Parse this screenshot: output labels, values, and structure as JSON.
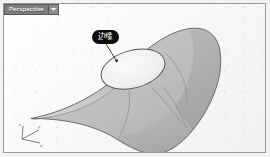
{
  "app": {
    "type": "3d-modeling-viewport",
    "background_color": "#fbfbfb"
  },
  "viewport": {
    "tab": {
      "label": "Perspective",
      "dropdown_icon": "chevron-down-icon",
      "background_color": "#7e7e7e",
      "text_color": "#f2f2f2"
    },
    "border_color": "#9a9a9a"
  },
  "annotation": {
    "callout": {
      "text": "边缘",
      "bubble_color": "#0d0d0d",
      "text_color": "#ffffff",
      "leader_line_color": "#3a3a3a"
    }
  },
  "axis_gizmo": {
    "labels": {
      "x": "x",
      "y": "y",
      "z": "z"
    },
    "line_color": "#6e6e6e",
    "text_color": "#5a5a5a"
  },
  "geometry": {
    "name": "trimmed-nurbs-surface",
    "surface_fill_light": "#c6c6c6",
    "surface_fill_mid": "#b4b4b4",
    "surface_fill_dark": "#a2a2a2",
    "surface_edge_color": "#6d6d6d",
    "hole": {
      "name": "elliptical-hole",
      "fill": "#f3f3f3",
      "edge_color": "#555555"
    },
    "isoparm_color": "#8a8a8a"
  }
}
